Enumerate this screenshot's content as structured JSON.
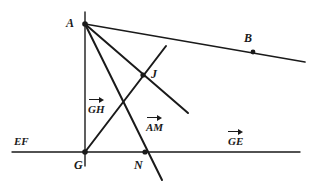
{
  "figure": {
    "type": "geometry-diagram",
    "width": 318,
    "height": 183,
    "background": "#ffffff",
    "stroke_color": "#1a1a1a",
    "points": [
      {
        "name": "A",
        "label": "A",
        "x": 85,
        "y": 24,
        "label_x": 66,
        "label_y": 17,
        "dot": true
      },
      {
        "name": "B",
        "label": "B",
        "x": 253,
        "y": 52,
        "label_x": 244,
        "label_y": 32,
        "dot": true
      },
      {
        "name": "J",
        "label": "J",
        "x": 143,
        "y": 75,
        "label_x": 151,
        "label_y": 68,
        "dot": true
      },
      {
        "name": "G",
        "label": "G",
        "x": 85,
        "y": 152,
        "label_x": 74,
        "label_y": 159,
        "dot": true
      },
      {
        "name": "N",
        "label": "N",
        "x": 145,
        "y": 152,
        "label_x": 134,
        "label_y": 159,
        "dot": true
      }
    ],
    "lines": [
      {
        "name": "line-EF-horizontal",
        "x1": 12,
        "y1": 152,
        "x2": 300,
        "y2": 152,
        "width": 1.4
      },
      {
        "name": "line-GH-vertical",
        "x1": 85,
        "y1": 12,
        "x2": 85,
        "y2": 166,
        "width": 1.4
      },
      {
        "name": "line-A-to-B",
        "x1": 85,
        "y1": 24,
        "x2": 305,
        "y2": 62,
        "width": 1.6
      },
      {
        "name": "segment-A-to-J-end",
        "x1": 85,
        "y1": 24,
        "x2": 188,
        "y2": 113,
        "width": 1.9
      },
      {
        "name": "segment-A-through-N",
        "x1": 85,
        "y1": 24,
        "x2": 162,
        "y2": 180,
        "width": 1.9
      },
      {
        "name": "segment-G-through-J",
        "x1": 85,
        "y1": 152,
        "x2": 166,
        "y2": 46,
        "width": 1.9
      }
    ],
    "labels": {
      "ef": {
        "text": "EF",
        "x": 14,
        "y": 136
      },
      "gh": {
        "text": "GH",
        "x": 88,
        "y": 96
      },
      "am": {
        "text": "AM",
        "x": 146,
        "y": 114
      },
      "ge": {
        "text": "GE",
        "x": 228,
        "y": 128
      }
    }
  }
}
